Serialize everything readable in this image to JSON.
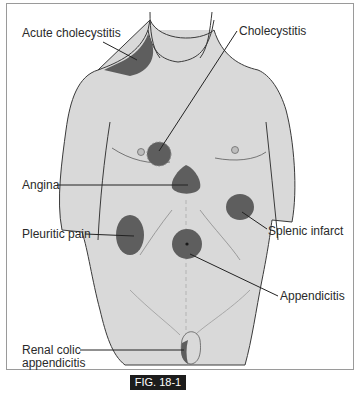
{
  "figure": {
    "caption": "FIG. 18-1",
    "colors": {
      "skin": "#d9d9d9",
      "pain_region": "#5e5e5e",
      "outline": "#3a3a3a",
      "caption_bg": "#1c1c1c"
    },
    "labels": {
      "acute_cholecystitis": "Acute cholecystitis",
      "cholecystitis": "Cholecystitis",
      "angina": "Angina",
      "pleuritic_pain": "Pleuritic pain",
      "splenic_infarct": "Splenic infarct",
      "appendicitis": "Appendicitis",
      "renal_colic_line1": "Renal colic",
      "renal_colic_line2": "appendicitis"
    }
  }
}
